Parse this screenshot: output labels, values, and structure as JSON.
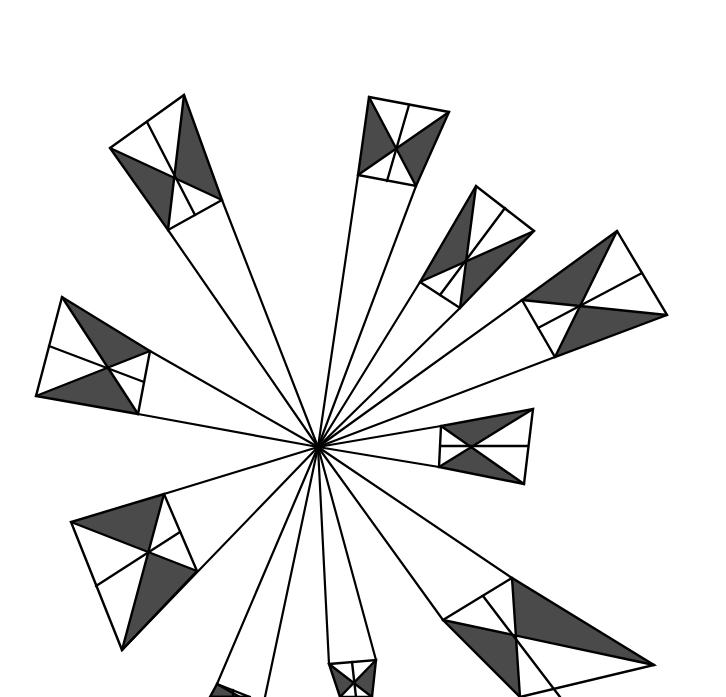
{
  "figure": {
    "title": "",
    "width": 726,
    "height": 697,
    "background": "#ffffff",
    "line_color": "#000000",
    "shade_color": "#4a4a4a",
    "center": [
      318,
      447
    ],
    "kites": [
      {
        "name": "kite-top-left",
        "near": [
          [
            168,
            230
          ],
          [
            222,
            200
          ]
        ],
        "far": [
          [
            184,
            95
          ],
          [
            110,
            148
          ]
        ],
        "shaded": "far-near-opposite",
        "mid": [
          [
            147,
            122
          ],
          [
            195,
            215
          ]
        ]
      },
      {
        "name": "kite-top",
        "near": [
          [
            358,
            175
          ],
          [
            416,
            186
          ]
        ],
        "far": [
          [
            449,
            112
          ],
          [
            369,
            97
          ]
        ],
        "shaded": "sides",
        "mid": [
          [
            409,
            105
          ],
          [
            387,
            181
          ]
        ]
      },
      {
        "name": "kite-upper-right",
        "near": [
          [
            420,
            282
          ],
          [
            460,
            308
          ]
        ],
        "far": [
          [
            534,
            231
          ],
          [
            476,
            186
          ]
        ],
        "shaded": "sides",
        "mid": [
          [
            505,
            208
          ],
          [
            440,
            295
          ]
        ]
      },
      {
        "name": "kite-right",
        "near": [
          [
            522,
            300
          ],
          [
            555,
            357
          ]
        ],
        "far": [
          [
            667,
            315
          ],
          [
            617,
            231
          ]
        ],
        "shaded": "top-bottom",
        "mid": [
          [
            642,
            273
          ],
          [
            538,
            328
          ]
        ]
      },
      {
        "name": "kite-left",
        "near": [
          [
            150,
            351
          ],
          [
            138,
            414
          ]
        ],
        "far": [
          [
            36,
            396
          ],
          [
            62,
            297
          ]
        ],
        "shaded": "top-bottom",
        "mid": [
          [
            49,
            346
          ],
          [
            144,
            382
          ]
        ]
      },
      {
        "name": "kite-right-mid",
        "near": [
          [
            441,
            426
          ],
          [
            439,
            467
          ]
        ],
        "far": [
          [
            524,
            484
          ],
          [
            533,
            409
          ]
        ],
        "shaded": "sides",
        "mid": [
          [
            528,
            446
          ],
          [
            440,
            446
          ]
        ]
      },
      {
        "name": "kite-lower-left",
        "near": [
          [
            164,
            494
          ],
          [
            197,
            571
          ]
        ],
        "far": [
          [
            122,
            650
          ],
          [
            71,
            522
          ]
        ],
        "shaded": "sides",
        "mid": [
          [
            96,
            586
          ],
          [
            180,
            532
          ]
        ]
      },
      {
        "name": "kite-lower-right",
        "near": [
          [
            443,
            620
          ],
          [
            512,
            578
          ]
        ],
        "far": [
          [
            654,
            665
          ],
          [
            520,
            697
          ]
        ],
        "shaded": "sides",
        "mid": [
          [
            483,
            596
          ],
          [
            560,
            697
          ]
        ]
      },
      {
        "name": "kite-bottom",
        "near": [
          [
            329,
            664
          ],
          [
            376,
            660
          ]
        ],
        "far": [
          [
            372,
            697
          ],
          [
            340,
            697
          ]
        ],
        "shaded": "top",
        "mid": [
          [
            352,
            662
          ],
          [
            356,
            697
          ]
        ]
      },
      {
        "name": "kite-bottom-left",
        "near": [
          [
            217,
            684
          ],
          [
            250,
            697
          ]
        ],
        "far": [
          [
            240,
            697
          ],
          [
            210,
            697
          ]
        ],
        "shaded": "top",
        "mid": [
          [
            233,
            690
          ],
          [
            233,
            697
          ]
        ]
      }
    ],
    "rays": [
      [
        [
          318,
          447
        ],
        [
          168,
          230
        ]
      ],
      [
        [
          318,
          447
        ],
        [
          222,
          200
        ]
      ],
      [
        [
          318,
          447
        ],
        [
          358,
          175
        ]
      ],
      [
        [
          318,
          447
        ],
        [
          416,
          186
        ]
      ],
      [
        [
          318,
          447
        ],
        [
          420,
          282
        ]
      ],
      [
        [
          318,
          447
        ],
        [
          460,
          308
        ]
      ],
      [
        [
          318,
          447
        ],
        [
          522,
          300
        ]
      ],
      [
        [
          318,
          447
        ],
        [
          555,
          357
        ]
      ],
      [
        [
          318,
          447
        ],
        [
          150,
          351
        ]
      ],
      [
        [
          318,
          447
        ],
        [
          138,
          414
        ]
      ],
      [
        [
          318,
          447
        ],
        [
          441,
          426
        ]
      ],
      [
        [
          318,
          447
        ],
        [
          439,
          467
        ]
      ],
      [
        [
          318,
          447
        ],
        [
          164,
          494
        ]
      ],
      [
        [
          318,
          447
        ],
        [
          122,
          650
        ]
      ],
      [
        [
          318,
          447
        ],
        [
          443,
          620
        ]
      ],
      [
        [
          318,
          447
        ],
        [
          512,
          578
        ]
      ],
      [
        [
          318,
          447
        ],
        [
          329,
          664
        ]
      ],
      [
        [
          318,
          447
        ],
        [
          376,
          660
        ]
      ],
      [
        [
          318,
          447
        ],
        [
          217,
          684
        ]
      ],
      [
        [
          318,
          447
        ],
        [
          265,
          697
        ]
      ]
    ]
  }
}
